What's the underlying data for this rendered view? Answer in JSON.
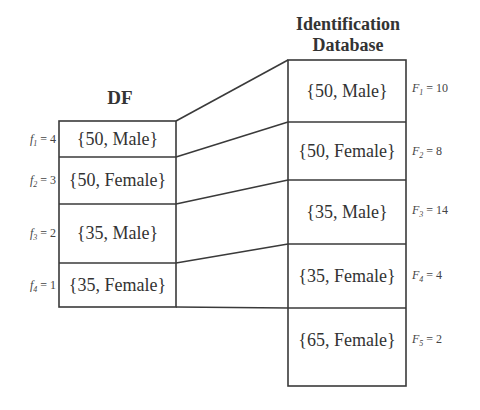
{
  "left_table": {
    "title": "DF",
    "rows": [
      {
        "value": "{50, Male}",
        "label_var": "f",
        "label_sub": "1",
        "label_eq": "= 4"
      },
      {
        "value": "{50, Female}",
        "label_var": "f",
        "label_sub": "2",
        "label_eq": "= 3"
      },
      {
        "value": "{35, Male}",
        "label_var": "f",
        "label_sub": "3",
        "label_eq": "= 2"
      },
      {
        "value": "{35, Female}",
        "label_var": "f",
        "label_sub": "4",
        "label_eq": "= 1"
      }
    ]
  },
  "right_table": {
    "title_line1": "Identification",
    "title_line2": "Database",
    "rows": [
      {
        "value": "{50, Male}",
        "label_var": "F",
        "label_sub": "1",
        "label_eq": "= 10"
      },
      {
        "value": "{50, Female}",
        "label_var": "F",
        "label_sub": "2",
        "label_eq": "= 8"
      },
      {
        "value": "{35, Male}",
        "label_var": "F",
        "label_sub": "3",
        "label_eq": "= 14"
      },
      {
        "value": "{35, Female}",
        "label_var": "F",
        "label_sub": "4",
        "label_eq": "= 4"
      },
      {
        "value": "{65, Female}",
        "label_var": "F",
        "label_sub": "5",
        "label_eq": "= 2"
      }
    ]
  },
  "colors": {
    "line": "#333333",
    "text": "#333333"
  }
}
